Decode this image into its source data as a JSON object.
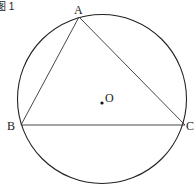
{
  "figure_label": "图 1",
  "points": {
    "A": {
      "label": "A"
    },
    "B": {
      "label": "B"
    },
    "C": {
      "label": "C"
    },
    "O": {
      "label": "O"
    }
  }
}
